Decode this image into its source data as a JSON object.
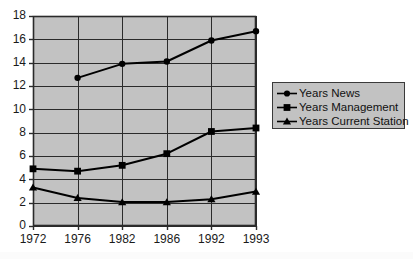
{
  "chart_data": {
    "type": "line",
    "title": "",
    "subtitle": "",
    "xlabel": "",
    "ylabel": "",
    "categories": [
      "1972",
      "1976",
      "1982",
      "1986",
      "1992",
      "1993"
    ],
    "ylim": [
      0,
      18
    ],
    "ytick_step": 2,
    "yticks": [
      "0",
      "2",
      "4",
      "6",
      "8",
      "10",
      "12",
      "14",
      "16",
      "18"
    ],
    "grid": true,
    "legend_position": "right",
    "plot_background": "#c2c2c2",
    "line_color": "#000000",
    "series": [
      {
        "name": "Years News",
        "marker": "diamond",
        "values": [
          null,
          12.7,
          13.9,
          14.1,
          15.9,
          16.7
        ]
      },
      {
        "name": "Years Management",
        "marker": "square",
        "values": [
          4.9,
          4.7,
          5.2,
          6.2,
          8.1,
          8.4
        ]
      },
      {
        "name": "Years Current Station",
        "marker": "triangle",
        "values": [
          3.3,
          2.4,
          2.05,
          2.05,
          2.3,
          2.95
        ]
      }
    ]
  },
  "legend": {
    "items": [
      {
        "label": "Years News",
        "marker": "diamond"
      },
      {
        "label": "Years Management",
        "marker": "square"
      },
      {
        "label": "Years Current Station",
        "marker": "triangle"
      }
    ]
  }
}
